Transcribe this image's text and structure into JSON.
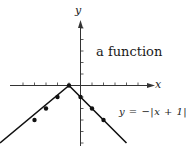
{
  "chart_data": {
    "type": "line",
    "title": "a function",
    "xlabel": "x",
    "ylabel": "y",
    "equation": "y = −|x + 1|",
    "xlim": [
      -6,
      6
    ],
    "ylim": [
      -5.5,
      6
    ],
    "grid": false,
    "legend": null,
    "x_ticks": [
      -5,
      -4,
      -3,
      -2,
      -1,
      1,
      2,
      3,
      4,
      5
    ],
    "y_ticks": [
      -5,
      -4,
      -3,
      -2,
      -1,
      1,
      2,
      3,
      4,
      5
    ],
    "series": [
      {
        "name": "y = −|x + 1|",
        "line_x": [
          -7,
          -1,
          4
        ],
        "line_y": [
          -5,
          0,
          -5
        ],
        "points": [
          {
            "x": -4,
            "y": -3
          },
          {
            "x": -3,
            "y": -2
          },
          {
            "x": -2,
            "y": -1
          },
          {
            "x": -1,
            "y": 0
          },
          {
            "x": 0,
            "y": -1
          },
          {
            "x": 1,
            "y": -2
          },
          {
            "x": 2,
            "y": -3
          }
        ]
      }
    ],
    "colors": {
      "line": "#111111",
      "axis": "#333333",
      "text": "#1a1a1a"
    }
  }
}
